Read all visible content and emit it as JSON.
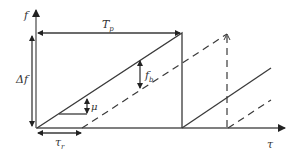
{
  "diagram": {
    "type": "FMCW sawtooth frequency-time diagram",
    "labels": {
      "y_axis": "f",
      "x_axis": "τ",
      "period": "T",
      "period_sub": "p",
      "bandwidth": "Δf",
      "beat_freq": "f",
      "beat_freq_sub": "b",
      "slope": "μ",
      "delay": "τ",
      "delay_sub": "r"
    },
    "series": [
      {
        "name": "transmitted",
        "style": "solid"
      },
      {
        "name": "received",
        "style": "dashed"
      }
    ],
    "colors": {
      "line": "#3a3a3a",
      "axis": "#555555",
      "text": "#333333",
      "background": "#ffffff"
    }
  }
}
